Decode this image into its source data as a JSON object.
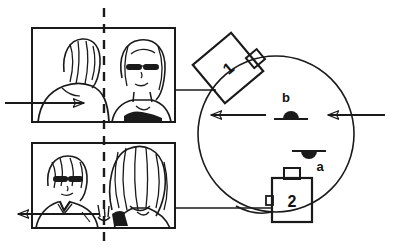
{
  "figure": {
    "type": "line-art-diagram",
    "background_color": "#ffffff",
    "ink_color": "#1a1a1a"
  },
  "panels": [
    {
      "id": "top-photo",
      "name": "photo-panel-top",
      "caption": "",
      "split_line": "dashed-vertical",
      "arrow": {
        "direction": "right",
        "name": "arrow-right-top"
      }
    },
    {
      "id": "bottom-photo",
      "name": "photo-panel-bottom",
      "caption": "",
      "split_line": "dashed-vertical",
      "arrow": {
        "direction": "left",
        "name": "arrow-left-bottom"
      }
    }
  ],
  "cameras": [
    {
      "id": "camera-1",
      "label": "1",
      "shape": "rotated-square",
      "rotation_deg": -40
    },
    {
      "id": "camera-2",
      "label": "2",
      "shape": "upright-rectangle",
      "rotation_deg": 0
    }
  ],
  "markers": [
    {
      "id": "marker-b",
      "label": "b",
      "shape": "bump-above-line",
      "position": "upper-center"
    },
    {
      "id": "marker-a",
      "label": "a",
      "shape": "bump-below-line",
      "position": "lower-center"
    }
  ],
  "arrows": [
    {
      "id": "arrow-into-circle-right",
      "direction": "left",
      "name": "arrow-entering-right"
    },
    {
      "id": "arrow-out-circle-left",
      "direction": "left",
      "name": "arrow-exiting-left"
    },
    {
      "id": "arrow-top-left",
      "direction": "right",
      "name": "arrow-top-left"
    },
    {
      "id": "arrow-bottom-left",
      "direction": "left",
      "name": "arrow-bottom-left"
    }
  ],
  "circle": {
    "id": "scene-circle",
    "name": "scene-circle",
    "label": ""
  }
}
